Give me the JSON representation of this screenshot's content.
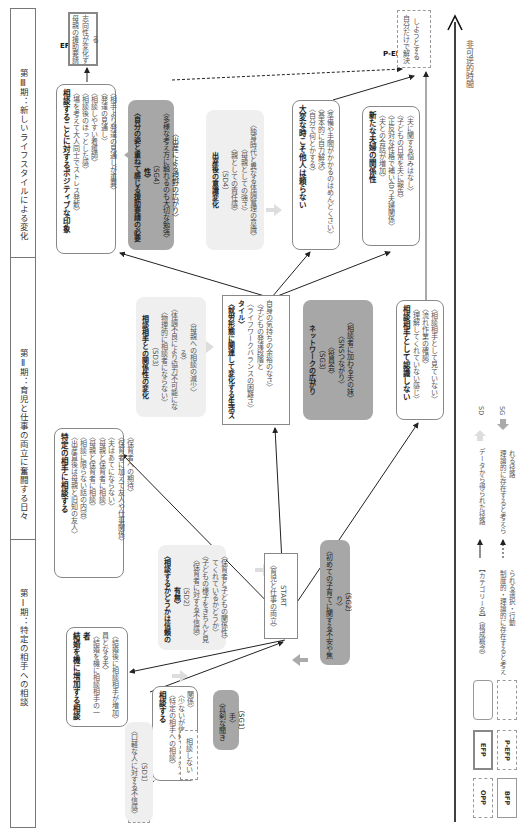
{
  "phases": [
    {
      "label": "第Ⅰ期：特定の相手への相談"
    },
    {
      "label": "第Ⅱ期：育児と仕事の両立に奮闘する日々"
    },
    {
      "label": "第Ⅲ期：新しいライフスタイルによる変化"
    }
  ],
  "time_axis": {
    "label": "非可逆的時間"
  },
  "nodes": {
    "opp": {
      "tag": "OPP",
      "text": "悩みが発生する"
    },
    "consult": {
      "title": "相談する",
      "lines": [
        "〈特定の相手への相談〉",
        "〈少ないが信頼できる対人関係〉"
      ]
    },
    "no_consult": {
      "text": "相談しない"
    },
    "marriage": {
      "title": "結婚を機に増加する相談者",
      "lines": [
        "〈結婚を機に相談相手の一員となる夫〉",
        "〈結婚後に相談相手が増加〉"
      ]
    },
    "bfp1": {
      "tag": "BFP①",
      "lines": [
        "〈育児と仕事の両立〉",
        "START"
      ]
    },
    "specific": {
      "title": "特定の相手に相談する",
      "lines": [
        "〈出産直後は母親と旧知の友人〉",
        "〈相談に限らない話の内容〉",
        "〈母親と保育者に相談〉",
        "〈母親と保育者に相談〉",
        "〈夫はあてにならない〉",
        "〈保育者に加えて友人や仕事関係〉",
        "〈保育者への期待〉"
      ]
    },
    "bfp2": {
      "tag": "BFP②",
      "title": "〈就労形態に関連して変化する生活スタイル〉",
      "lines": [
        "〈ライフワークバランスの困難さ〉",
        "〈子どもの発達段階と",
        "自身の気持ちの余裕のなさ〉"
      ]
    },
    "not_recognize": {
      "title": "相談相手として認識しない",
      "lines": [
        "〈理解してくれていない感じ〉",
        "〈流れ作業の確認〉",
        "〈相談相手として見ていない〉"
      ]
    },
    "positive": {
      "title": "相談することに対するポジティブな印象",
      "lines": [
        "〈場を考えて大人同士でストレス発散〉",
        "〈相談後のほっとした感〉",
        "〈相談しやすい看護師〉",
        "〈発達の見通し〉",
        "〈相手より発達の見通しが重要〉"
      ]
    },
    "not_rely": {
      "title": "大変な時こそ他人は頼らない",
      "lines": [
        "〈自分で何とかする〉",
        "〈基本的に自力解決〉",
        "〈準備や手間がかかるのはめんどくさい〉"
      ]
    },
    "couple": {
      "title": "新たな夫婦の関係性",
      "lines": [
        "〈夫との会話が増加〉",
        "〈正反対な性格で補い合う夫婦関係〉",
        "〈子どもの日常を夫に報告〉",
        "〈夫に関する悩みはなし〉"
      ]
    },
    "efp": {
      "tag": "EFP",
      "text": "母親の援助要請志向性が変化する"
    },
    "pefp": {
      "tag": "P-EFP",
      "text": "自分だけで解決しようとする"
    }
  },
  "forces": {
    "sd1": {
      "lines": [
        "〈口軽な人に対する不信感〉",
        "（SD1）"
      ]
    },
    "sg1": {
      "lines": [
        "〈真剣な聞き手〉",
        "（SG1）"
      ]
    },
    "sd2": {
      "title": "〈相談するかどうかは信頼の有無〉",
      "code": "（SD2）",
      "lines": [
        "〈保育者に対する不信感〉",
        "〈子どもの様子をきちんと見てくれているかどうか〉",
        "〈保育者と子どもの関係性〉"
      ]
    },
    "sg2": {
      "lines": [
        "〈初めての子育てに関する不安や焦り〉",
        "（SG2）"
      ]
    },
    "sd3": {
      "title": "相談相手との関係性の変化",
      "code": "（SD3）",
      "lines": [
        "〈物理的に相談者にならない〉",
        "〈体調不良により協力不可能になる〉",
        "〈母親への相談の減少〉"
      ]
    },
    "sg3": {
      "title": "ネットワークの広がり",
      "code": "（SG3）",
      "lines": [
        "〈役員会〉",
        "〈SNSつながり〉",
        "〈相談者に加わる夫の妹〉"
      ]
    },
    "sd4": {
      "title": "出産後の意識変化",
      "code": "（SD4）",
      "lines": [
        "〈親としての責任感〉",
        "〈母親としての強さ〉",
        "〈独身時代と異なる体調管理の意識〉"
      ]
    },
    "sg4": {
      "title": "〈自分の姿と重ねて感じる援助要請の必要性〉",
      "code": "（SG4）",
      "lines": [
        "〈多様な考え方に触れるのも大切な勉強〉",
        "〈出産による視野の広がり〉"
      ]
    }
  },
  "legend": {
    "opp": "OPP",
    "efp": "EFP",
    "bfp": "BFP",
    "pefp": "P-EFP",
    "category_label": "【カテゴリー名】〈構成概念〉",
    "institutional_label": "制度的・理論的に存在すると考えられる選択・行動",
    "solid_arrow_label": "データから得られた径路",
    "dashed_arrow_label": "理論的に存在すると考えられる径路",
    "sd_label": "SD",
    "sg_label": "SG"
  },
  "colors": {
    "sd_fill": "#efefef",
    "sg_fill": "#a7a7a7",
    "line": "#222222",
    "border": "#888888"
  }
}
